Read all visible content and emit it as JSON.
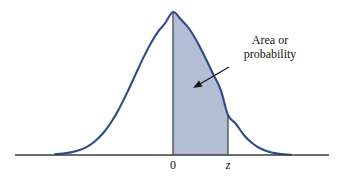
{
  "figure": {
    "name": "standard-normal-area-diagram",
    "background_color": "#ffffff",
    "width": 340,
    "height": 186
  },
  "annotation": {
    "line1": "Area or",
    "line2": "probability",
    "text_color": "#141414",
    "arrow": {
      "name": "annotation-arrow",
      "tail_x": 229,
      "tail_y": 67,
      "tip_x": 193,
      "tip_y": 88,
      "color": "#141414"
    }
  },
  "axis": {
    "name": "horizontal-axis",
    "color": "#3d3d3d",
    "x_start": 15,
    "x_end": 329,
    "y": 155,
    "ticks": [
      {
        "label": "0",
        "x": 173,
        "italic": false
      },
      {
        "label": "z",
        "x": 228,
        "italic": true
      }
    ]
  },
  "chart_data": {
    "type": "area",
    "title": "",
    "subtitle": "",
    "xlabel": "",
    "ylabel": "",
    "grid": false,
    "legend": null,
    "distribution": "standard normal",
    "curve_color": "#2e4a8a",
    "shaded_fill_color": "#b3bdd4",
    "shaded_region": {
      "label": "Area or probability",
      "from_tick": "0",
      "to_tick": "z",
      "from_x": 173,
      "to_x": 228
    },
    "tick_labels": [
      "0",
      "z"
    ],
    "annotations": [
      "Area or",
      "probability"
    ],
    "peak": {
      "x": 173,
      "y": 12
    },
    "baseline_y": 155,
    "curve_left_x": 55,
    "curve_right_x": 291,
    "curve_height_at_z": 115,
    "x": [
      55,
      63,
      71,
      79,
      87,
      95,
      103,
      111,
      119,
      127,
      135,
      143,
      151,
      159,
      165,
      173,
      181,
      189,
      197,
      205,
      213,
      221,
      228,
      236,
      244,
      252,
      260,
      268,
      276,
      284,
      291
    ],
    "y": [
      154.3,
      153.6,
      152.4,
      150.3,
      146.8,
      141.3,
      133.3,
      122.5,
      108.9,
      92.9,
      75.6,
      58.4,
      42.9,
      30.4,
      23.4,
      12.0,
      19.6,
      28.5,
      41.5,
      57.0,
      73.8,
      90.6,
      115.0,
      124.0,
      135.2,
      143.0,
      148.3,
      151.6,
      153.4,
      154.3,
      154.8
    ]
  }
}
